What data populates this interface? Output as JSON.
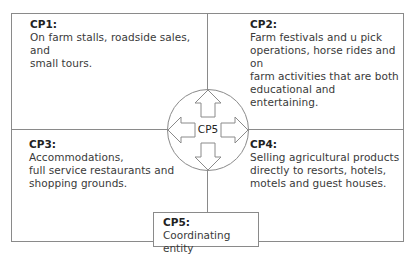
{
  "diagram": {
    "quadrants": [
      {
        "id": "CP1",
        "label": "CP1:",
        "lines": [
          "On farm stalls, roadside sales, and",
          "small tours."
        ]
      },
      {
        "id": "CP2",
        "label": "CP2:",
        "lines": [
          "Farm festivals and u pick",
          "operations, horse rides and on",
          "farm activities that are both",
          "educational and entertaining."
        ]
      },
      {
        "id": "CP3",
        "label": "CP3:",
        "lines": [
          "Accommodations,",
          "full service restaurants and",
          "shopping grounds."
        ]
      },
      {
        "id": "CP4",
        "label": "CP4:",
        "lines": [
          "Selling agricultural products",
          "directly to resorts, hotels,",
          "motels and guest houses."
        ]
      }
    ],
    "hub": {
      "label": "CP5",
      "icon": "four-way-arrows-in-circle"
    },
    "coordinator": {
      "label": "CP5:",
      "text_line1": " Coordinating",
      "text_line2": "entity"
    }
  },
  "colors": {
    "lines": "#8a8a8a",
    "label_text": "#222222",
    "body_text": "#3a3a3a",
    "background": "#ffffff"
  }
}
